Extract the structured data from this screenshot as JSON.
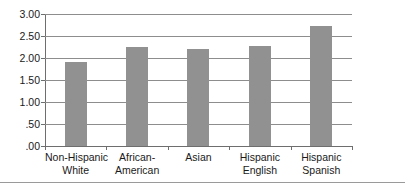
{
  "chart_data": {
    "type": "bar",
    "title": "",
    "subtitle": "",
    "xlabel": "",
    "ylabel": "",
    "categories": [
      "Non-Hispanic White",
      "African-American",
      "Asian",
      "Hispanic English",
      "Hispanic Spanish"
    ],
    "category_lines": [
      [
        "Non-Hispanic",
        "White"
      ],
      [
        "African-",
        "American"
      ],
      [
        "Asian",
        ""
      ],
      [
        "Hispanic",
        "English"
      ],
      [
        "Hispanic",
        "Spanish"
      ]
    ],
    "values": [
      1.91,
      2.25,
      2.2,
      2.27,
      2.72
    ],
    "ylim": [
      0,
      3.0
    ],
    "ytick_values": [
      3.0,
      2.5,
      2.0,
      1.5,
      1.0,
      0.5,
      0.0
    ],
    "ytick_labels": [
      "3.00",
      "2.50",
      "2.00",
      "1.50",
      "1.00",
      ".50",
      ".00"
    ],
    "grid": true,
    "grid_axis": "y",
    "legend": false,
    "legend_position": "none",
    "bar_color": "#919191",
    "grid_color": "#8d8d8d",
    "axis_color": "#6e6e6e",
    "background_color": "#ffffff"
  }
}
